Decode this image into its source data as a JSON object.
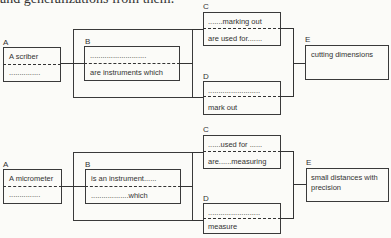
{
  "header_text": "and generalizations from them.",
  "diagrams": [
    {
      "A": {
        "label": "A",
        "top": "A scriber",
        "bottom": "..............."
      },
      "B": {
        "label": "B",
        "top": "...........................",
        "bottom": "are instruments which"
      },
      "C": {
        "label": "C",
        "top": ".......marking out",
        "bottom": "are used for......."
      },
      "D": {
        "label": "D",
        "top": ".........................",
        "bottom": "mark out"
      },
      "E": {
        "label": "E",
        "line1": "cutting dimensions",
        "line2": ""
      }
    },
    {
      "A": {
        "label": "A",
        "top": "A micrometer",
        "bottom": "..............."
      },
      "B": {
        "label": "B",
        "top": "is an instrument......",
        "bottom": "..................which"
      },
      "C": {
        "label": "C",
        "top": "......used for ......",
        "bottom": "are......measuring"
      },
      "D": {
        "label": "D",
        "top": ".........................",
        "bottom": "measure"
      },
      "E": {
        "label": "E",
        "line1": "small distances with",
        "line2": "precision"
      }
    }
  ]
}
